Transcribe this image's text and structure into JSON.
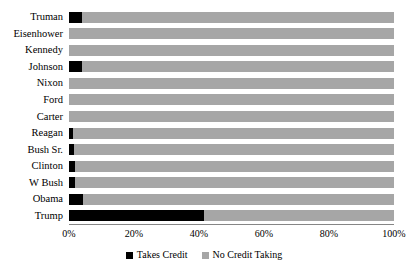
{
  "chart_data": {
    "type": "bar",
    "orientation": "horizontal",
    "stacked": true,
    "stacked_normalized": true,
    "title": "",
    "xlabel": "",
    "ylabel": "",
    "xlim": [
      0,
      100
    ],
    "grid": false,
    "legend_position": "bottom",
    "x_tick_labels": [
      "0%",
      "20%",
      "40%",
      "60%",
      "80%",
      "100%"
    ],
    "x_tick_values": [
      0,
      20,
      40,
      60,
      80,
      100
    ],
    "categories": [
      "Truman",
      "Eisenhower",
      "Kennedy",
      "Johnson",
      "Nixon",
      "Ford",
      "Carter",
      "Reagan",
      "Bush Sr.",
      "Clinton",
      "W Bush",
      "Obama",
      "Trump"
    ],
    "series": [
      {
        "name": "Takes Credit",
        "color": "#000000",
        "values": [
          4.0,
          0.0,
          0.0,
          4.0,
          0.0,
          0.0,
          0.0,
          1.2,
          1.5,
          1.8,
          1.8,
          4.3,
          41.4
        ]
      },
      {
        "name": "No Credit Taking",
        "color": "#a6a6a6",
        "values": [
          96.0,
          100.0,
          100.0,
          96.0,
          100.0,
          100.0,
          100.0,
          98.8,
          98.5,
          98.2,
          98.2,
          95.7,
          58.6
        ]
      }
    ],
    "legend": [
      {
        "label": "Takes Credit",
        "color": "#000000"
      },
      {
        "label": "No Credit Taking",
        "color": "#a6a6a6"
      }
    ]
  }
}
